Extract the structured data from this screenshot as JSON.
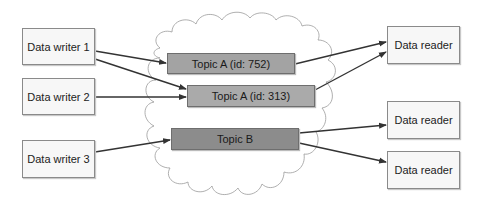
{
  "diagram": {
    "writers": [
      {
        "label": "Data writer 1"
      },
      {
        "label": "Data writer 2"
      },
      {
        "label": "Data writer 3"
      }
    ],
    "topics": [
      {
        "label": "Topic A (id: 752)",
        "color": "#a3a3a3"
      },
      {
        "label": "Topic A (id: 313)",
        "color": "#aaaaaa"
      },
      {
        "label": "Topic B",
        "color": "#8c8c8c"
      }
    ],
    "readers": [
      {
        "label": "Data reader"
      },
      {
        "label": "Data reader"
      },
      {
        "label": "Data reader"
      }
    ],
    "connections": [
      {
        "from": "Data writer 1",
        "to": "Topic A (id: 752)"
      },
      {
        "from": "Data writer 1",
        "to": "Topic A (id: 313)"
      },
      {
        "from": "Data writer 2",
        "to": "Topic A (id: 313)"
      },
      {
        "from": "Data writer 3",
        "to": "Topic B"
      },
      {
        "from": "Topic A (id: 752)",
        "to": "Data reader 1"
      },
      {
        "from": "Topic A (id: 313)",
        "to": "Data reader 1"
      },
      {
        "from": "Topic B",
        "to": "Data reader 2"
      },
      {
        "from": "Topic B",
        "to": "Data reader 3"
      }
    ]
  }
}
